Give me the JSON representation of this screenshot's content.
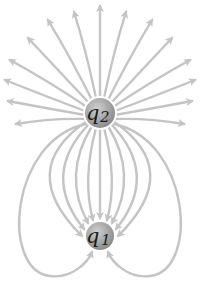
{
  "diagram": {
    "type": "electric-field-lines",
    "colors": {
      "field_line": "#c4c4c4",
      "charge_fill": "#9a9a9a",
      "charge_highlight": "#d0d0d0",
      "label": "#1a1a1a"
    },
    "charges": [
      {
        "id": "q2",
        "symbol": "q",
        "subscript": "2",
        "cx": 100,
        "cy": 113,
        "r": 15,
        "field_direction": "outward"
      },
      {
        "id": "q1",
        "symbol": "q",
        "subscript": "1",
        "cx": 100,
        "cy": 236,
        "r": 14,
        "field_direction": "inward"
      }
    ]
  }
}
